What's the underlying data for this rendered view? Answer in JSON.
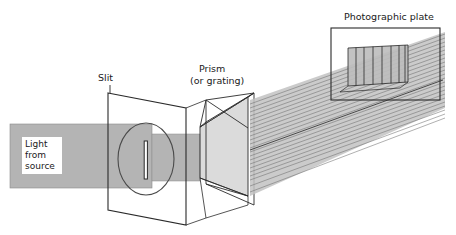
{
  "figure": {
    "title_visible": false,
    "background_color": "#ffffff",
    "labels": {
      "slit": "Slit",
      "prism_line1": "Prism",
      "prism_line2": "(or grating)",
      "photographic_plate": "Photographic plate",
      "source_line1": "Light",
      "source_line2": "from",
      "source_line3": "source"
    },
    "colors": {
      "ink": "#2a2a2a",
      "beam_gray": "#b4b4b4",
      "beam_gray_light": "#c8c8c8",
      "plate_fill": "#bdbdbd",
      "ray_line": "#6e6e6e",
      "label_box": "#ffffff"
    },
    "components": [
      {
        "name": "light-source-beam",
        "description": "Horizontal gray collimated beam entering from left",
        "label": "Light from source"
      },
      {
        "name": "slit-plane",
        "description": "Tilted rectangular screen in perspective containing a circular lens and a narrow vertical slit",
        "label": "Slit"
      },
      {
        "name": "prism",
        "description": "Triangular prism drawn in 3D perspective which disperses the beam",
        "label": "Prism (or grating)"
      },
      {
        "name": "dispersed-beam",
        "description": "Fan of rays fanning upward to the right after refraction",
        "ray_count": 22
      },
      {
        "name": "photographic-plate",
        "description": "Rectangular frame at upper right containing the recorded spectrum band divided into spectral lines",
        "label": "Photographic plate",
        "spectral_divisions": 7
      }
    ]
  }
}
